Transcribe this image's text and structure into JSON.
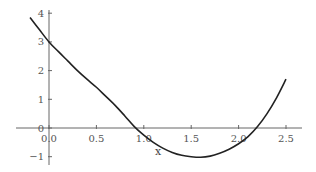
{
  "chart_data": {
    "type": "line",
    "title": "",
    "xlabel": "x",
    "ylabel": "",
    "xlim": [
      -0.22,
      2.65
    ],
    "ylim": [
      -1.4,
      4.1
    ],
    "grid": false,
    "legend": null,
    "x_ticks": [
      "0.0",
      "0.5",
      "1.0",
      "1.5",
      "2.0",
      "2.5"
    ],
    "y_ticks": [
      "−1",
      "0",
      "1",
      "2",
      "3",
      "4"
    ],
    "series": [
      {
        "name": "f(x)",
        "color": "#222222",
        "x": [
          -0.2,
          -0.1,
          0.0,
          0.1,
          0.2,
          0.3,
          0.4,
          0.5,
          0.6,
          0.7,
          0.8,
          0.9,
          1.0,
          1.1,
          1.2,
          1.3,
          1.4,
          1.5,
          1.6,
          1.7,
          1.8,
          1.9,
          2.0,
          2.1,
          2.2,
          2.3,
          2.4,
          2.5
        ],
        "y": [
          3.85,
          3.42,
          3.0,
          2.66,
          2.33,
          2.0,
          1.7,
          1.42,
          1.1,
          0.78,
          0.42,
          0.05,
          -0.25,
          -0.5,
          -0.7,
          -0.85,
          -0.95,
          -1.0,
          -1.02,
          -0.98,
          -0.88,
          -0.74,
          -0.55,
          -0.3,
          0.05,
          0.5,
          1.05,
          1.7
        ]
      }
    ]
  }
}
